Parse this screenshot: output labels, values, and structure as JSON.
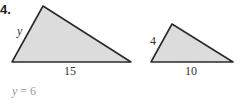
{
  "problem": {
    "number": "4.",
    "triangles": [
      {
        "id": "large",
        "side_labels": {
          "left": "y",
          "base": "15"
        },
        "vertices": [
          [
            12,
            62
          ],
          [
            43,
            6
          ],
          [
            131,
            62
          ]
        ]
      },
      {
        "id": "small",
        "side_labels": {
          "left": "4",
          "base": "10"
        },
        "vertices": [
          [
            151,
            62
          ],
          [
            172,
            24
          ],
          [
            233,
            62
          ]
        ]
      }
    ],
    "answer": {
      "variable": "y",
      "equals": "= 6"
    },
    "colors": {
      "fill": "#dcdcdc",
      "stroke": "#2a2a2a",
      "answer_text": "#9a9a9a"
    }
  }
}
